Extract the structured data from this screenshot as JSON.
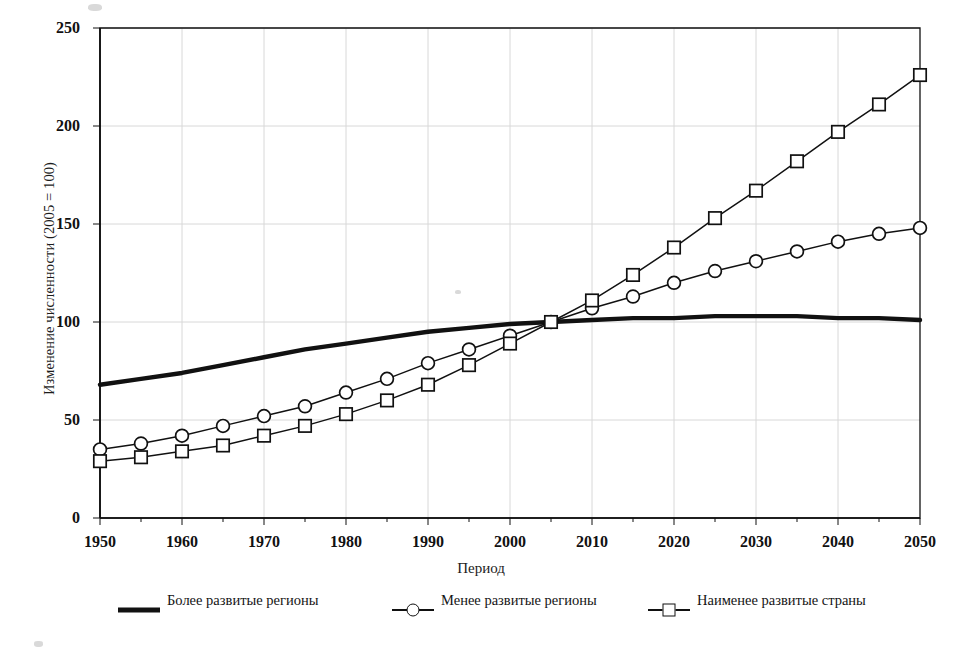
{
  "chart_data": {
    "type": "line",
    "title": "",
    "xlabel": "Период",
    "ylabel": "Изменение численности (2005 = 100)",
    "xlim": [
      1950,
      2050
    ],
    "ylim": [
      0,
      250
    ],
    "yticks": [
      0,
      50,
      100,
      150,
      200,
      250
    ],
    "xticks": [
      1950,
      1960,
      1970,
      1980,
      1990,
      2000,
      2010,
      2020,
      2030,
      2040,
      2050
    ],
    "x_minor_step": 5,
    "grid": true,
    "legend_position": "bottom",
    "x": [
      1950,
      1955,
      1960,
      1965,
      1970,
      1975,
      1980,
      1985,
      1990,
      1995,
      2000,
      2005,
      2010,
      2015,
      2020,
      2025,
      2030,
      2035,
      2040,
      2045,
      2050
    ],
    "series": [
      {
        "name": "Более развитые регионы",
        "marker": "none",
        "line": "thick",
        "values": [
          68,
          71,
          74,
          78,
          82,
          86,
          89,
          92,
          95,
          97,
          99,
          100,
          101,
          102,
          102,
          103,
          103,
          103,
          102,
          102,
          101
        ]
      },
      {
        "name": "Менее развитые регионы",
        "marker": "circle",
        "line": "thin",
        "values": [
          35,
          38,
          42,
          47,
          52,
          57,
          64,
          71,
          79,
          86,
          93,
          100,
          107,
          113,
          120,
          126,
          131,
          136,
          141,
          145,
          148
        ]
      },
      {
        "name": "Наименее развитые страны",
        "marker": "square",
        "line": "thin",
        "values": [
          29,
          31,
          34,
          37,
          42,
          47,
          53,
          60,
          68,
          78,
          89,
          100,
          111,
          124,
          138,
          153,
          167,
          182,
          197,
          211,
          226
        ]
      }
    ]
  },
  "axes": {
    "ylabel": "Изменение численности (2005 = 100)",
    "xlabel": "Период",
    "ytick_labels": [
      "0",
      "50",
      "100",
      "150",
      "200",
      "250"
    ],
    "xtick_labels": [
      "1950",
      "1960",
      "1970",
      "1980",
      "1990",
      "2000",
      "2010",
      "2020",
      "2030",
      "2040",
      "2050"
    ]
  },
  "legend": {
    "items": [
      {
        "label": "Более развитые регионы",
        "key": "thick-line-key",
        "marker": "none"
      },
      {
        "label": "Менее развитые регионы",
        "key": "circle-marker-key",
        "marker": "circle"
      },
      {
        "label": "Наименее развитые страны",
        "key": "square-marker-key",
        "marker": "square"
      }
    ]
  },
  "style": {
    "ink": "#111111",
    "grid_color": "#d8d8d8",
    "background": "#ffffff"
  }
}
